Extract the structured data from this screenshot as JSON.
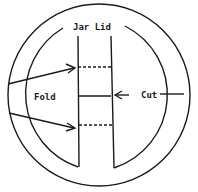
{
  "diagram": {
    "title": "Jar Lid",
    "labels": {
      "fold": "Fold",
      "cut": "Cut"
    },
    "fold_lines": 2,
    "cut_lines": 1,
    "line_color": "#1a1a1a",
    "background": "#ffffff"
  }
}
